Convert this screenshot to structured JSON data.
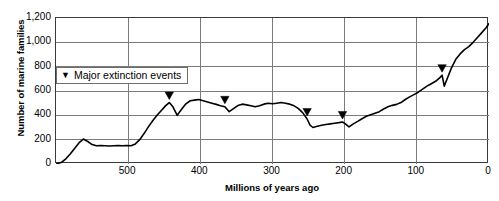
{
  "chart_data": {
    "type": "line",
    "title": "",
    "xlabel": "Millions of years ago",
    "ylabel": "Number of marine families",
    "xlim": [
      600,
      0
    ],
    "ylim": [
      0,
      1200
    ],
    "x_reversed": true,
    "grid": true,
    "legend_position": "upper-left",
    "legend_entries": [
      {
        "marker": "triangle-down",
        "label": "Major extinction events"
      }
    ],
    "xticks": [
      500,
      400,
      300,
      200,
      100,
      0
    ],
    "xtick_labels": [
      "500",
      "400",
      "300",
      "200",
      "100",
      "0"
    ],
    "yticks": [
      0,
      200,
      400,
      600,
      800,
      1000,
      1200
    ],
    "ytick_labels": [
      "0",
      "200",
      "400",
      "600",
      "800",
      "1,000",
      "1,200"
    ],
    "series": [
      {
        "name": "Number of marine families",
        "color": "#000000",
        "x": [
          600,
          592,
          586,
          580,
          574,
          568,
          562,
          556,
          550,
          544,
          538,
          532,
          526,
          520,
          514,
          508,
          502,
          496,
          490,
          484,
          478,
          472,
          466,
          460,
          454,
          448,
          443,
          438,
          432,
          426,
          420,
          414,
          408,
          402,
          396,
          390,
          384,
          378,
          372,
          366,
          360,
          354,
          348,
          342,
          336,
          330,
          324,
          318,
          312,
          306,
          300,
          294,
          288,
          282,
          276,
          270,
          264,
          258,
          252,
          248,
          244,
          238,
          232,
          226,
          220,
          214,
          208,
          203,
          199,
          194,
          188,
          182,
          176,
          170,
          164,
          158,
          152,
          146,
          140,
          134,
          128,
          122,
          116,
          110,
          104,
          98,
          92,
          86,
          80,
          74,
          68,
          65,
          62,
          58,
          52,
          46,
          40,
          34,
          28,
          22,
          16,
          10,
          4,
          0
        ],
        "y": [
          0,
          15,
          45,
          85,
          130,
          175,
          205,
          185,
          160,
          150,
          152,
          150,
          148,
          150,
          152,
          150,
          152,
          150,
          165,
          200,
          250,
          305,
          355,
          400,
          440,
          480,
          505,
          470,
          400,
          450,
          495,
          520,
          525,
          530,
          520,
          510,
          500,
          490,
          478,
          470,
          430,
          455,
          480,
          492,
          486,
          478,
          470,
          478,
          492,
          500,
          495,
          500,
          505,
          500,
          492,
          478,
          455,
          420,
          370,
          320,
          300,
          310,
          318,
          325,
          330,
          335,
          340,
          345,
          330,
          305,
          330,
          350,
          372,
          392,
          405,
          418,
          430,
          452,
          470,
          482,
          490,
          505,
          530,
          552,
          570,
          590,
          615,
          640,
          660,
          680,
          710,
          730,
          640,
          700,
          790,
          860,
          905,
          940,
          965,
          1000,
          1040,
          1080,
          1120,
          1155
        ]
      }
    ],
    "annotations": [
      {
        "name": "ordovician-extinction",
        "x": 443,
        "y": 505,
        "marker": "triangle-down"
      },
      {
        "name": "devonian-extinction",
        "x": 366,
        "y": 470,
        "marker": "triangle-down"
      },
      {
        "name": "permian-extinction",
        "x": 252,
        "y": 370,
        "marker": "triangle-down"
      },
      {
        "name": "triassic-extinction",
        "x": 203,
        "y": 345,
        "marker": "triangle-down"
      },
      {
        "name": "cretaceous-extinction",
        "x": 65,
        "y": 730,
        "marker": "triangle-down"
      }
    ],
    "colors": {
      "line": "#000000",
      "grid": "#7a7a7a",
      "frame": "#3a3a3a",
      "background": "#ffffff",
      "text": "#000000"
    }
  },
  "legend": {
    "marker_glyph": "▼",
    "label": "Major extinction events"
  },
  "axes": {
    "x_title": "Millions of years ago",
    "y_title": "Number of marine families"
  },
  "title_remnant": ""
}
